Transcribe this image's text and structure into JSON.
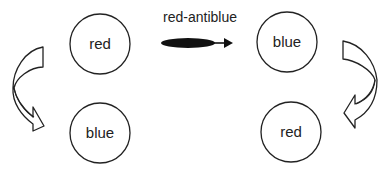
{
  "diagram": {
    "label": "red-antiblue",
    "left": {
      "top_node": "red",
      "bottom_node": "blue"
    },
    "right": {
      "top_node": "blue",
      "bottom_node": "red"
    },
    "colors": {
      "stroke": "#222222",
      "fill": "#ffffff",
      "ellipse": "#111111"
    }
  }
}
